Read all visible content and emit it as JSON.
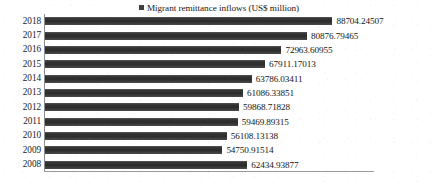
{
  "chart_data": {
    "type": "bar",
    "orientation": "horizontal",
    "title": "",
    "xlabel": "",
    "ylabel": "",
    "grid": false,
    "legend_position": "top-center",
    "legend": [
      "Migrant remittance inflows (US$ million)"
    ],
    "series_color": "#3b3b3b",
    "categories": [
      "2018",
      "2017",
      "2016",
      "2015",
      "2014",
      "2013",
      "2012",
      "2011",
      "2010",
      "2009",
      "2008"
    ],
    "values": [
      88704.24507,
      80876.79465,
      72963.60955,
      67911.17013,
      63786.03411,
      61086.33851,
      59868.71828,
      59469.89315,
      56108.13138,
      54750.91514,
      62434.93877
    ],
    "data_labels": [
      "88704.24507",
      "80876.79465",
      "72963.60955",
      "67911.17013",
      "63786.03411",
      "61086.33851",
      "59868.71828",
      "59469.89315",
      "56108.13138",
      "54750.91514",
      "62434.93877"
    ],
    "xlim": [
      0,
      100000
    ],
    "series": [
      {
        "name": "Migrant remittance inflows (US$ million)",
        "values": [
          88704.24507,
          80876.79465,
          72963.60955,
          67911.17013,
          63786.03411,
          61086.33851,
          59868.71828,
          59469.89315,
          56108.13138,
          54750.91514,
          62434.93877
        ]
      }
    ]
  },
  "legend": {
    "marker_name": "legend-color-swatch",
    "label": "Migrant remittance inflows (US$ million)"
  },
  "rows": [
    {
      "category": "2018",
      "value_label": "88704.24507"
    },
    {
      "category": "2017",
      "value_label": "80876.79465"
    },
    {
      "category": "2016",
      "value_label": "72963.60955"
    },
    {
      "category": "2015",
      "value_label": "67911.17013"
    },
    {
      "category": "2014",
      "value_label": "63786.03411"
    },
    {
      "category": "2013",
      "value_label": "61086.33851"
    },
    {
      "category": "2012",
      "value_label": "59868.71828"
    },
    {
      "category": "2011",
      "value_label": "59469.89315"
    },
    {
      "category": "2010",
      "value_label": "56108.13138"
    },
    {
      "category": "2009",
      "value_label": "54750.91514"
    },
    {
      "category": "2008",
      "value_label": "62434.93877"
    }
  ]
}
